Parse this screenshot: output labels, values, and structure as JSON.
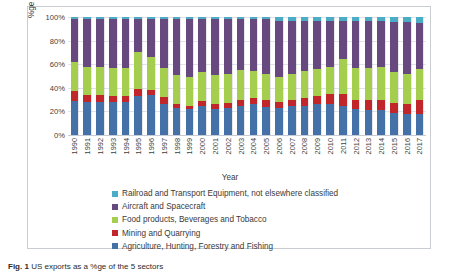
{
  "figure": {
    "caption_label": "Fig. 1",
    "caption_text": "US exports as a %ge of the 5 sectors"
  },
  "chart_data": {
    "type": "bar",
    "subtype": "100% stacked column",
    "title": "",
    "xlabel": "Year",
    "ylabel": "%ge share of the 5 sectors",
    "ylim": [
      0,
      100
    ],
    "ytick_labels": [
      "0%",
      "20%",
      "40%",
      "60%",
      "80%",
      "100%"
    ],
    "yticks": [
      0,
      20,
      40,
      60,
      80,
      100
    ],
    "grid": true,
    "legend_position": "bottom",
    "categories": [
      "1990",
      "1991",
      "1992",
      "1993",
      "1994",
      "1995",
      "1996",
      "1997",
      "1998",
      "1999",
      "2000",
      "2001",
      "2002",
      "2003",
      "2004",
      "2005",
      "2006",
      "2007",
      "2008",
      "2009",
      "2010",
      "2011",
      "2012",
      "2013",
      "2014",
      "2015",
      "2016",
      "2017"
    ],
    "series": [
      {
        "name": "Agriculture, Hunting, Forestry and Fishing",
        "color": "#4472A8",
        "values": [
          29,
          28,
          28,
          28,
          28,
          33,
          34,
          26,
          23,
          22,
          25,
          22,
          23,
          25,
          26,
          24,
          23,
          25,
          25,
          26,
          26,
          25,
          22,
          21,
          21,
          19,
          18,
          18
        ]
      },
      {
        "name": "Mining and Quarrying",
        "color": "#C0262A",
        "values": [
          8,
          6,
          6,
          5,
          5,
          6,
          4,
          6,
          3,
          3,
          4,
          4,
          4,
          5,
          5,
          6,
          5,
          5,
          6,
          7,
          9,
          10,
          8,
          9,
          9,
          8,
          8,
          12
        ]
      },
      {
        "name": "Food products, Beverages and Tobacco",
        "color": "#A5CE4E",
        "values": [
          25,
          24,
          24,
          24,
          24,
          31,
          28,
          25,
          25,
          24,
          24,
          25,
          25,
          25,
          23,
          22,
          21,
          22,
          23,
          23,
          23,
          29,
          27,
          27,
          28,
          26,
          26,
          26
        ]
      },
      {
        "name": "Aircraft and Spacecraft",
        "color": "#68497F",
        "values": [
          36,
          40,
          40,
          41,
          41,
          28,
          32,
          41,
          47,
          49,
          45,
          47,
          46,
          43,
          44,
          46,
          48,
          45,
          43,
          41,
          39,
          33,
          40,
          40,
          39,
          43,
          44,
          39
        ]
      },
      {
        "name": "Railroad and Transport Equipment, not elsewhere classified",
        "color": "#4BACC6",
        "values": [
          2,
          2,
          2,
          2,
          2,
          2,
          2,
          2,
          2,
          2,
          2,
          2,
          2,
          2,
          2,
          2,
          3,
          3,
          3,
          3,
          3,
          3,
          3,
          3,
          3,
          4,
          4,
          5
        ]
      }
    ]
  },
  "legend": {
    "items": [
      {
        "label": "Railroad and Transport Equipment, not elsewhere classified",
        "color": "#4BACC6"
      },
      {
        "label": "Aircraft and Spacecraft",
        "color": "#68497F"
      },
      {
        "label": "Food products, Beverages and Tobacco",
        "color": "#A5CE4E"
      },
      {
        "label": "Mining and Quarrying",
        "color": "#C0262A"
      },
      {
        "label": "Agriculture, Hunting, Forestry and Fishing",
        "color": "#4472A8"
      }
    ]
  }
}
